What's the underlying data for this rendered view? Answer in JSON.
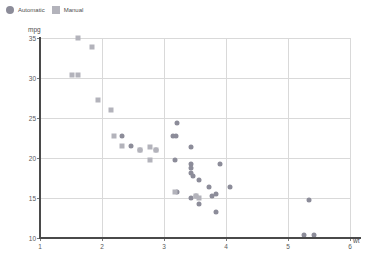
{
  "legend": {
    "position": "top-left",
    "items": [
      {
        "label": "Automatic",
        "marker": "circle",
        "color": "#8c8c99"
      },
      {
        "label": "Manual",
        "marker": "square",
        "color": "#b3b3bb"
      }
    ]
  },
  "colors": {
    "automatic": "#8c8c99",
    "manual": "#b3b3bb",
    "grid": "#d9d9d9",
    "spine": "#4a4a4a",
    "background": "#ffffff",
    "text": "#4d4d4d"
  },
  "axes": {
    "ylabel": "mpg",
    "xlabel": "wt",
    "yticks": [
      10,
      15,
      20,
      25,
      30,
      35
    ],
    "xticks": [
      1,
      2,
      3,
      4,
      5,
      6
    ],
    "ylim": [
      10,
      35
    ],
    "xlim": [
      1,
      6
    ],
    "grid": true
  },
  "chart_data": {
    "type": "scatter",
    "title": "",
    "xlabel": "wt",
    "ylabel": "mpg",
    "xlim": [
      1,
      6
    ],
    "ylim": [
      10,
      35
    ],
    "grid": true,
    "legend_position": "top-left",
    "series": [
      {
        "name": "Automatic",
        "marker": "circle",
        "color": "#8c8c99",
        "points": [
          {
            "x": 3.215,
            "y": 24.4
          },
          {
            "x": 3.19,
            "y": 22.8
          },
          {
            "x": 3.44,
            "y": 21.4
          },
          {
            "x": 3.44,
            "y": 19.2
          },
          {
            "x": 3.44,
            "y": 18.7
          },
          {
            "x": 3.44,
            "y": 18.1
          },
          {
            "x": 3.46,
            "y": 17.8
          },
          {
            "x": 3.57,
            "y": 17.3
          },
          {
            "x": 3.73,
            "y": 16.4
          },
          {
            "x": 3.78,
            "y": 15.2
          },
          {
            "x": 3.84,
            "y": 15.5
          },
          {
            "x": 3.845,
            "y": 13.3
          },
          {
            "x": 3.9,
            "y": 19.2
          },
          {
            "x": 4.07,
            "y": 16.4
          },
          {
            "x": 3.52,
            "y": 15.2
          },
          {
            "x": 3.57,
            "y": 14.3
          },
          {
            "x": 3.44,
            "y": 15.0
          },
          {
            "x": 5.25,
            "y": 10.4
          },
          {
            "x": 5.424,
            "y": 10.4
          },
          {
            "x": 5.345,
            "y": 14.7
          },
          {
            "x": 2.32,
            "y": 22.8
          },
          {
            "x": 2.62,
            "y": 21.0
          },
          {
            "x": 2.875,
            "y": 21.0
          },
          {
            "x": 3.15,
            "y": 22.8
          },
          {
            "x": 2.465,
            "y": 21.5
          },
          {
            "x": 3.17,
            "y": 19.7
          },
          {
            "x": 3.215,
            "y": 15.8
          }
        ]
      },
      {
        "name": "Manual",
        "marker": "square",
        "color": "#b3b3bb",
        "points": [
          {
            "x": 1.615,
            "y": 35.0
          },
          {
            "x": 1.835,
            "y": 33.9
          },
          {
            "x": 1.513,
            "y": 30.4
          },
          {
            "x": 1.615,
            "y": 30.4
          },
          {
            "x": 1.935,
            "y": 27.3
          },
          {
            "x": 2.14,
            "y": 26.0
          },
          {
            "x": 2.2,
            "y": 22.8
          },
          {
            "x": 2.32,
            "y": 21.5
          },
          {
            "x": 2.62,
            "y": 21.0
          },
          {
            "x": 2.77,
            "y": 21.4
          },
          {
            "x": 2.875,
            "y": 21.0
          },
          {
            "x": 2.78,
            "y": 19.7
          },
          {
            "x": 3.17,
            "y": 15.8
          },
          {
            "x": 3.57,
            "y": 15.0
          },
          {
            "x": 3.52,
            "y": 15.2
          }
        ]
      }
    ]
  }
}
